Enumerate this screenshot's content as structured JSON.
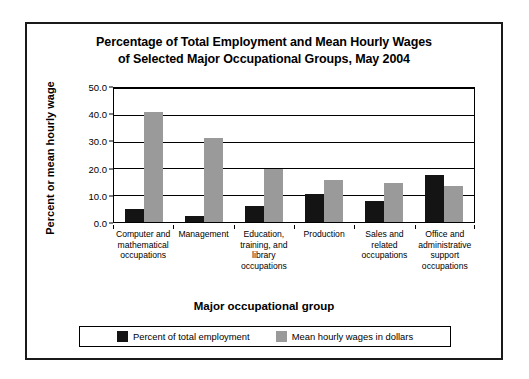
{
  "chart_data": {
    "type": "bar",
    "title": "Percentage of Total Employment and Mean Hourly Wages of Selected Major Occupational Groups, May 2004",
    "title_lines": [
      "Percentage of Total Employment and Mean Hourly Wages",
      "of Selected Major Occupational Groups, May 2004"
    ],
    "xlabel": "Major occupational group",
    "ylabel": "Percent or mean hourly wage",
    "ylim": [
      0,
      50
    ],
    "ytick_labels": [
      "50.0",
      "40.0",
      "30.0",
      "20.0",
      "10.0",
      "0.0"
    ],
    "ytick_values": [
      50,
      40,
      30,
      20,
      10,
      0
    ],
    "grid": true,
    "legend_position": "bottom",
    "categories": [
      "Computer and mathematical occupations",
      "Management",
      "Education, training, and library occupations",
      "Production",
      "Sales and related occupations",
      "Office and administrative support occupations"
    ],
    "category_lines": [
      [
        "Computer and",
        "mathematical",
        "occupations"
      ],
      [
        "Management"
      ],
      [
        "Education,",
        "training, and",
        "library",
        "occupations"
      ],
      [
        "Production"
      ],
      [
        "Sales and",
        "related",
        "occupations"
      ],
      [
        "Office and",
        "administrative",
        "support",
        "occupations"
      ]
    ],
    "series": [
      {
        "name": "Percent of total employment",
        "color": "#141414",
        "values": [
          4.8,
          2.2,
          6.0,
          10.5,
          8.0,
          17.5
        ]
      },
      {
        "name": "Mean hourly wages in dollars",
        "color": "#9a9a9a",
        "values": [
          41.0,
          31.5,
          19.7,
          15.5,
          14.5,
          13.5
        ]
      }
    ]
  }
}
